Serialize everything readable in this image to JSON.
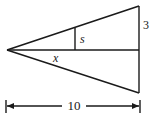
{
  "diagram": {
    "type": "geometry-similar-triangles",
    "labels": {
      "s": "s",
      "x": "x",
      "side": "3",
      "width": "10"
    },
    "points": {
      "apex": [
        7,
        50
      ],
      "top_right": [
        139,
        6
      ],
      "bottom_right": [
        139,
        93
      ],
      "mid_right": [
        139,
        50
      ],
      "s_top": [
        75,
        28
      ],
      "s_bottom": [
        75,
        50
      ]
    },
    "dimension": {
      "y": 106,
      "left_x": 6,
      "right_x": 140,
      "label": "10"
    },
    "colors": {
      "stroke": "#1a1a1a",
      "background": "#ffffff"
    }
  }
}
